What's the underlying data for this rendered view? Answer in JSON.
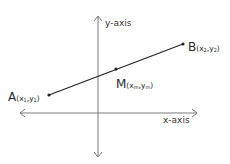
{
  "axes": {
    "y_label": "y-axis",
    "x_label": "x-axis",
    "color": "#7a7a7a"
  },
  "segment": {
    "color": "#222222"
  },
  "points": {
    "A": {
      "name": "A",
      "coord_open": "(x",
      "sub1": "1",
      "coord_mid": ",y",
      "sub2": "1",
      "coord_close": ")"
    },
    "B": {
      "name": "B",
      "coord_open": "(x",
      "sub1": "2",
      "coord_mid": ",y",
      "sub2": "2",
      "coord_close": ")"
    },
    "M": {
      "name": "M",
      "coord_open": "(x",
      "sub1": "m",
      "coord_mid": ",y",
      "sub2": "m",
      "coord_close": ")"
    }
  }
}
